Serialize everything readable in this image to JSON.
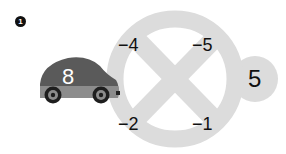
{
  "problem": {
    "number_badge": "1",
    "car": {
      "value": "8",
      "body_color": "#5a5a5a",
      "lower_color": "#8a8a8a"
    },
    "wheel": {
      "ring_color": "#d9d9d9",
      "labels": {
        "top_left": "−4",
        "top_right": "−5",
        "bottom_left": "−2",
        "bottom_right": "−1"
      }
    },
    "result": {
      "value": "5",
      "circle_color": "#dcdcdc"
    }
  }
}
